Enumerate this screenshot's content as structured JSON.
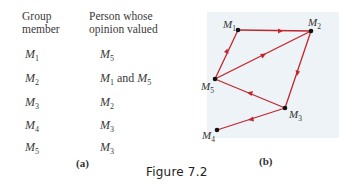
{
  "table": {
    "headers": {
      "col1_line1": "Group",
      "col1_line2": "member",
      "col2_line1": "Person whose",
      "col2_line2": "opinion valued"
    },
    "rows": [
      {
        "member": "M",
        "member_sub": "1",
        "valued": [
          {
            "m": "M",
            "sub": "5"
          }
        ],
        "valued_text": ""
      },
      {
        "member": "M",
        "member_sub": "2",
        "valued": [
          {
            "m": "M",
            "sub": "1"
          },
          {
            "m": "M",
            "sub": "5"
          }
        ],
        "valued_text": "and"
      },
      {
        "member": "M",
        "member_sub": "3",
        "valued": [
          {
            "m": "M",
            "sub": "2"
          }
        ],
        "valued_text": ""
      },
      {
        "member": "M",
        "member_sub": "4",
        "valued": [
          {
            "m": "M",
            "sub": "3"
          }
        ],
        "valued_text": ""
      },
      {
        "member": "M",
        "member_sub": "5",
        "valued": [
          {
            "m": "M",
            "sub": "3"
          }
        ],
        "valued_text": ""
      }
    ],
    "caption": "(a)"
  },
  "graph": {
    "caption": "(b)",
    "edge_color": "#c0272d",
    "node_color": "#111111",
    "background": "#eef3f7",
    "nodes": [
      {
        "id": "M1",
        "label": "M",
        "sub": "1"
      },
      {
        "id": "M2",
        "label": "M",
        "sub": "2"
      },
      {
        "id": "M3",
        "label": "M",
        "sub": "3"
      },
      {
        "id": "M4",
        "label": "M",
        "sub": "4"
      },
      {
        "id": "M5",
        "label": "M",
        "sub": "5"
      }
    ],
    "edges": [
      {
        "from": "M1",
        "to": "M2"
      },
      {
        "from": "M5",
        "to": "M1"
      },
      {
        "from": "M5",
        "to": "M2"
      },
      {
        "from": "M2",
        "to": "M3"
      },
      {
        "from": "M3",
        "to": "M5"
      },
      {
        "from": "M3",
        "to": "M4"
      }
    ]
  },
  "figure_caption": "Figure 7.2"
}
